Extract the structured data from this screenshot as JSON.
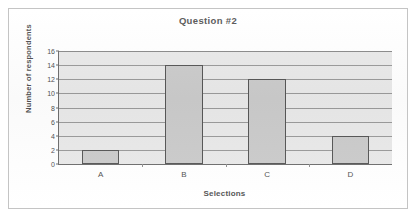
{
  "chart_data": {
    "type": "bar",
    "title": "Question #2",
    "xlabel": "Selections",
    "ylabel": "Number of respondents",
    "categories": [
      "A",
      "B",
      "C",
      "D"
    ],
    "values": [
      2,
      14,
      12,
      4
    ],
    "ylim": [
      0,
      16
    ],
    "yticks": [
      0,
      2,
      4,
      6,
      8,
      10,
      12,
      14,
      16
    ],
    "ytick_labels": [
      "0",
      "2",
      "4",
      "6",
      "8",
      "10",
      "12",
      "14",
      "16"
    ],
    "grid": true,
    "legend": false,
    "colors": {
      "bar_fill": "#cbcbcb",
      "bar_border": "#565656",
      "plot_background": "#e9e9e9",
      "gridline": "#9a9a9a",
      "axis_line": "#6d6d6d",
      "text": "#4f4f4f",
      "frame_border": "#c4c4c4",
      "page_background": "#ffffff"
    }
  }
}
